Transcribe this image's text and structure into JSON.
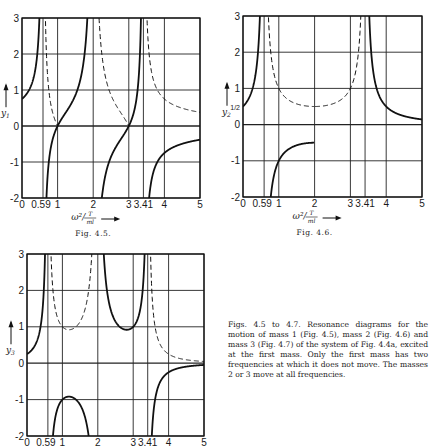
{
  "chart_data": [
    {
      "type": "line",
      "figure": "Fig. 4.5.",
      "title": "",
      "ylabel": "y1",
      "ylabel_sub": "1",
      "xlabel": "ω²/(T/ml)",
      "xlabel_num": "T",
      "xlabel_den": "ml",
      "xlim": [
        0,
        5
      ],
      "ylim": [
        -2,
        3
      ],
      "x_ticks": [
        "0",
        "0.59",
        "1",
        "2",
        "3",
        "3.41",
        "4",
        "5"
      ],
      "x_tick_values": [
        0,
        0.59,
        1,
        2,
        3,
        3.41,
        4,
        5
      ],
      "y_ticks": [
        "3",
        "2",
        "1",
        "0",
        "-1",
        "-2"
      ],
      "y_tick_values": [
        3,
        2,
        1,
        0,
        -1,
        -2
      ],
      "grid": true,
      "resonances": [
        0.586,
        2,
        3.414
      ],
      "function": "y1 = (a^2-1)/(a^3-2a), a = 2 - x",
      "series": [
        {
          "name": "y1 (solid)",
          "style": "solid",
          "points": [
            [
              0,
              0.75
            ],
            [
              0.3,
              1.05
            ],
            [
              0.5,
              2.2
            ],
            [
              0.7,
              -1.6
            ],
            [
              1,
              0
            ],
            [
              1.5,
              0.83
            ],
            [
              1.8,
              2.3
            ],
            [
              2.2,
              -2.3
            ],
            [
              2.5,
              -0.83
            ],
            [
              3,
              0
            ],
            [
              3.3,
              2.0
            ],
            [
              3.6,
              -1.56
            ],
            [
              4,
              -0.75
            ],
            [
              4.5,
              -0.5
            ],
            [
              5,
              -0.38
            ]
          ]
        },
        {
          "name": "|y1| of negative part (dashed)",
          "style": "dashed",
          "points": [
            [
              0.7,
              1.6
            ],
            [
              1,
              0
            ],
            [
              2.2,
              2.3
            ],
            [
              2.5,
              0.83
            ],
            [
              3,
              0
            ],
            [
              3.6,
              1.56
            ],
            [
              4,
              0.75
            ],
            [
              4.5,
              0.5
            ],
            [
              5,
              0.38
            ]
          ]
        }
      ]
    },
    {
      "type": "line",
      "figure": "Fig. 4.6.",
      "title": "",
      "ylabel": "y2",
      "ylabel_sub": "2",
      "extra_ytick": "1/2",
      "xlabel": "ω²/(T/ml)",
      "xlabel_num": "T",
      "xlabel_den": "ml",
      "xlim": [
        0,
        5
      ],
      "ylim": [
        -2,
        3
      ],
      "x_ticks": [
        "0",
        "0.59",
        "1",
        "2",
        "3",
        "3.41",
        "4",
        "5"
      ],
      "x_tick_values": [
        0,
        0.59,
        1,
        2,
        3,
        3.41,
        4,
        5
      ],
      "y_ticks": [
        "3",
        "2",
        "1",
        "0",
        "-1",
        "-2"
      ],
      "y_tick_values": [
        3,
        2,
        1,
        0,
        -1,
        -2
      ],
      "grid": true,
      "resonances": [
        0.586,
        3.414
      ],
      "function": "y2 = a/(a^3-2a), a = 2 - x",
      "series": [
        {
          "name": "y2 (solid)",
          "style": "solid",
          "points": [
            [
              0,
              0.5
            ],
            [
              0.3,
              0.88
            ],
            [
              0.5,
              3.0
            ],
            [
              1,
              -1
            ],
            [
              1.5,
              -0.57
            ],
            [
              2,
              -0.5
            ],
            [
              2.5,
              -0.57
            ],
            [
              3,
              -1
            ],
            [
              3.5,
              3.0
            ],
            [
              4,
              0.5
            ],
            [
              4.5,
              0.24
            ],
            [
              5,
              0.14
            ]
          ]
        },
        {
          "name": "|y2| of negative part (dashed)",
          "style": "dashed",
          "points": [
            [
              1,
              1
            ],
            [
              1.5,
              0.57
            ],
            [
              2,
              0.5
            ],
            [
              2.5,
              0.57
            ],
            [
              3,
              1
            ]
          ]
        }
      ]
    },
    {
      "type": "line",
      "figure": "",
      "title": "",
      "ylabel": "y3",
      "ylabel_sub": "3",
      "xlabel": "ω²/(T/ml)",
      "xlim": [
        0,
        5
      ],
      "ylim": [
        -2,
        3
      ],
      "x_ticks": [
        "0",
        "0.59",
        "1",
        "2",
        "3",
        "3.41",
        "4",
        "5"
      ],
      "x_tick_values": [
        0,
        0.59,
        1,
        2,
        3,
        3.41,
        4,
        5
      ],
      "y_ticks": [
        "3",
        "2",
        "1",
        "0",
        "-1",
        "-2"
      ],
      "y_tick_values": [
        3,
        2,
        1,
        0,
        -1,
        -2
      ],
      "grid": true,
      "resonances": [
        0.586,
        2,
        3.414
      ],
      "function": "y3 = 1/(a^3-2a), a = 2 - x",
      "series": [
        {
          "name": "y3 (solid)",
          "style": "solid",
          "points": [
            [
              0,
              0.25
            ],
            [
              0.3,
              0.48
            ],
            [
              1,
              -1
            ],
            [
              1.3,
              -0.92
            ],
            [
              2.2,
              5.0
            ],
            [
              2.5,
              1.14
            ],
            [
              2.7,
              0.96
            ],
            [
              3,
              1
            ],
            [
              4,
              -0.25
            ],
            [
              5,
              -0.05
            ]
          ]
        },
        {
          "name": "|y3| of negative part (dashed)",
          "style": "dashed",
          "points": [
            [
              1,
              1
            ],
            [
              1.3,
              0.92
            ],
            [
              4,
              0.25
            ],
            [
              5,
              0.05
            ]
          ]
        }
      ]
    }
  ],
  "captions": {
    "fig1": "Fig. 4.5.",
    "fig2": "Fig. 4.6.",
    "text": "Figs. 4.5 to 4.7. Resonance diagrams for the motion of mass 1 (Fig. 4.5), mass 2 (Fig. 4.6) and mass 3 (Fig. 4.7) of the system of Fig. 4.4a, excited at the first mass. Only the first mass has two frequencies at which it does not move. The masses 2 or 3 move at all frequencies."
  }
}
